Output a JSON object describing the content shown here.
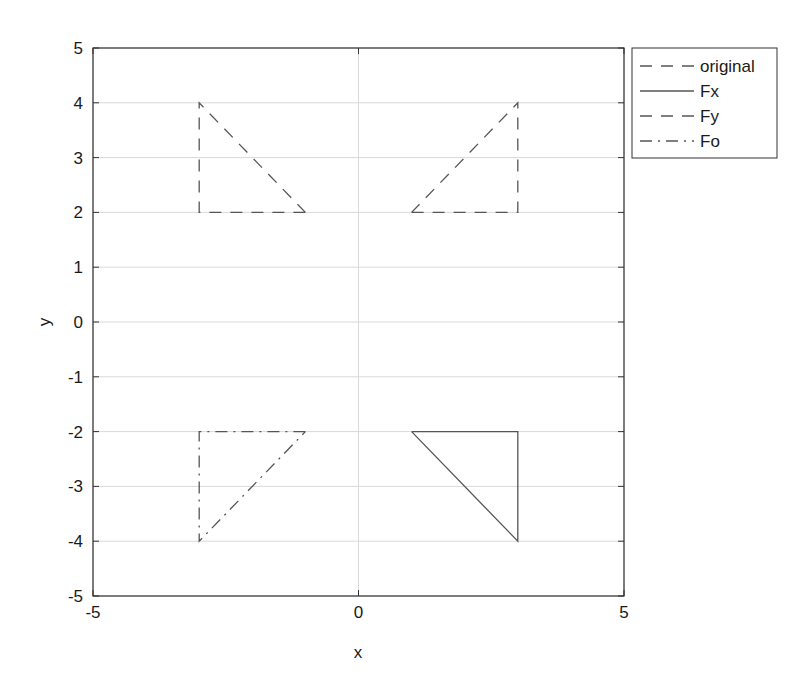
{
  "chart_data": {
    "type": "line",
    "title": "",
    "xlabel": "x",
    "ylabel": "y",
    "xlim": [
      -5,
      5
    ],
    "ylim": [
      -5,
      5
    ],
    "xticks": [
      "-5",
      "0",
      "5"
    ],
    "yticks": [
      "5",
      "4",
      "3",
      "2",
      "1",
      "0",
      "-1",
      "-2",
      "-3",
      "-4",
      "-5"
    ],
    "grid": true,
    "legend_position": "outside-top-right",
    "series": [
      {
        "name": "original",
        "style": "dashed",
        "x": [
          1,
          3,
          3,
          1
        ],
        "y": [
          2,
          2,
          4,
          2
        ]
      },
      {
        "name": "Fx",
        "style": "solid",
        "x": [
          1,
          3,
          3,
          1
        ],
        "y": [
          -2,
          -2,
          -4,
          -2
        ]
      },
      {
        "name": "Fy",
        "style": "dashed",
        "x": [
          -1,
          -3,
          -3,
          -1
        ],
        "y": [
          2,
          2,
          4,
          2
        ]
      },
      {
        "name": "Fo",
        "style": "dash-dot",
        "x": [
          -1,
          -3,
          -3,
          -1
        ],
        "y": [
          -2,
          -2,
          -4,
          -2
        ]
      }
    ]
  },
  "colors": {
    "line": "#555555",
    "grid": "#d9d9d9",
    "axis": "#333333"
  },
  "legend": {
    "items": [
      {
        "label": "original"
      },
      {
        "label": "Fx"
      },
      {
        "label": "Fy"
      },
      {
        "label": "Fo"
      }
    ]
  },
  "axes": {
    "xlabel": "x",
    "ylabel": "y"
  }
}
